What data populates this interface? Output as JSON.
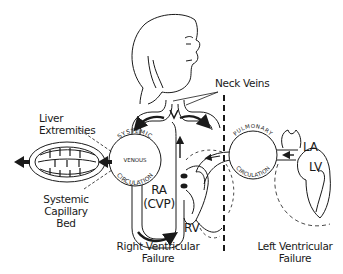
{
  "diagram": {
    "labels": {
      "neck_veins": "Neck Veins",
      "liver": "Liver",
      "extremities": "Extremities",
      "systemic_bed_line1": "Systemic",
      "systemic_bed_line2": "Capillary",
      "systemic_bed_line3": "Bed",
      "ra": "RA",
      "cvp": "(CVP)",
      "rv": "RV",
      "la": "LA",
      "lv": "LV",
      "right_failure_line1": "Right Ventricular",
      "right_failure_line2": "Failure",
      "left_failure_line1": "Left Ventricular",
      "left_failure_line2": "Failure"
    },
    "circle_texts": {
      "systemic_top": "SYSTEMIC",
      "systemic_mid": "VENOUS",
      "systemic_bottom": "CIRCULATION",
      "pulmonary_top": "PULMONARY",
      "pulmonary_bottom": "CIRCULATION"
    },
    "colors": {
      "ink": "#1a1a1a",
      "background": "#ffffff"
    }
  }
}
